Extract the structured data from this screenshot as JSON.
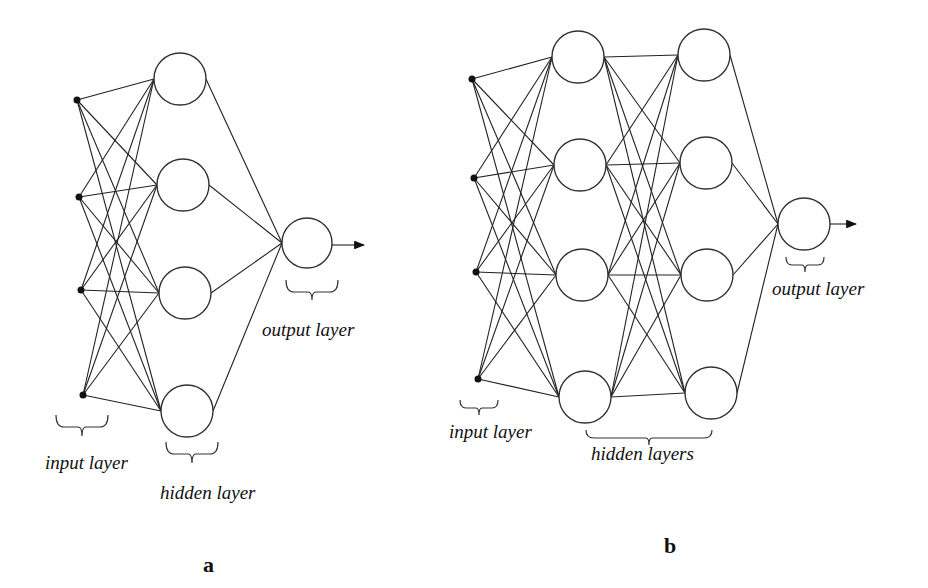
{
  "diagrams": [
    {
      "id": "a",
      "caption": "a",
      "labels": {
        "input": "input layer",
        "hidden": "hidden layer",
        "output": "output layer"
      },
      "layers": {
        "input_nodes": 4,
        "hidden_nodes": [
          4
        ],
        "output_nodes": 1
      }
    },
    {
      "id": "b",
      "caption": "b",
      "labels": {
        "input": "input layer",
        "hidden": "hidden layers",
        "output": "output layer"
      },
      "layers": {
        "input_nodes": 4,
        "hidden_nodes": [
          4,
          4
        ],
        "output_nodes": 1
      }
    }
  ],
  "colors": {
    "line": "#222222",
    "background": "#ffffff"
  }
}
